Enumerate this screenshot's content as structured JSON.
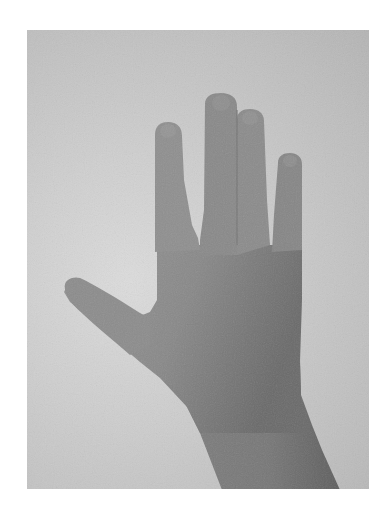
{
  "image": {
    "subject": "Back of a left hand with fingers spread, photographed against a plain light background",
    "alt": "Grayscale photograph of an open hand, back side facing the viewer, fingers spread apart",
    "colors": {
      "page_background": "#ffffff",
      "photo_background": "#c8c8c8",
      "skin": "#8a8a8a",
      "skin_shadow": "#6c6c6c",
      "skin_highlight": "#9a9a9a",
      "nail": "#939393"
    }
  }
}
